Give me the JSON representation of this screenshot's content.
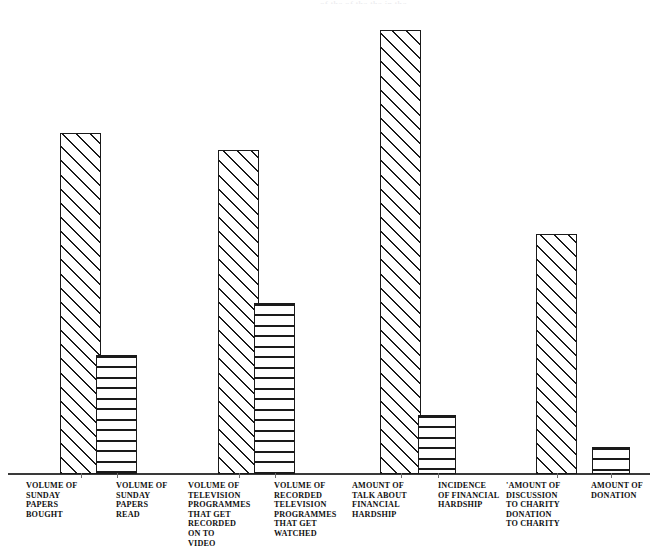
{
  "figure": {
    "background_color": "#ffffff",
    "ink_color": "#1a1a1a",
    "axis_color": "#3a3a3a",
    "baseline_y": 474,
    "top_cut_text": "of      the      of the        the          in the"
  },
  "chart_data": {
    "type": "bar",
    "title": "",
    "subtitle": "",
    "xlabel": "",
    "ylabel": "",
    "grid": false,
    "legend": "none",
    "axis": {
      "y_axis_visible": false,
      "x_axis_visible": true,
      "tick_labels_visible": false,
      "ylim": [
        0,
        480
      ]
    },
    "value_units": "relative volume (pixel height, unlabelled axis)",
    "categories": [
      "VOLUME OF\nSUNDAY\nPAPERS\nBOUGHT",
      "VOLUME OF\nSUNDAY\nPAPERS\nREAD",
      "VOLUME OF\nTELEVISION\nPROGRAMMES\nTHAT GET\nRECORDED\nON TO\nVIDEO",
      "VOLUME OF\nRECORDED\nTELEVISION\nPROGRAMMES\nTHAT GET\nWATCHED",
      "AMOUNT OF\nTALK ABOUT\nFINANCIAL\nHARDSHIP",
      "INCIDENCE\nOF FINANCIAL\nHARDSHIP",
      "'AMOUNT OF\nDISCUSSION\nTO CHARITY\nDONATION\nTO CHARITY",
      "AMOUNT OF\nDONATION"
    ],
    "values": [
      341,
      119,
      324,
      171,
      444,
      59,
      240,
      27
    ],
    "bars": [
      {
        "index": 1,
        "label": "VOLUME OF\nSUNDAY\nPAPERS\nBOUGHT",
        "value": 341,
        "pattern": "diagonal-hatch",
        "x": 60,
        "width": 41,
        "top": 133,
        "label_x": 26,
        "label_width": 70,
        "tick_x": 81
      },
      {
        "index": 2,
        "label": "VOLUME OF\nSUNDAY\nPAPERS\nREAD",
        "value": 119,
        "pattern": "horizontal-hatch",
        "x": 96,
        "width": 41,
        "top": 355,
        "label_x": 116,
        "label_width": 70,
        "tick_x": 117
      },
      {
        "index": 3,
        "label": "VOLUME OF\nTELEVISION\nPROGRAMMES\nTHAT GET\nRECORDED\nON TO\nVIDEO",
        "value": 324,
        "pattern": "diagonal-hatch",
        "x": 218,
        "width": 41,
        "top": 150,
        "label_x": 188,
        "label_width": 74,
        "tick_x": 239
      },
      {
        "index": 4,
        "label": "VOLUME OF\nRECORDED\nTELEVISION\nPROGRAMMES\nTHAT GET\nWATCHED",
        "value": 171,
        "pattern": "horizontal-hatch",
        "x": 254,
        "width": 41,
        "top": 303,
        "label_x": 274,
        "label_width": 74,
        "tick_x": 275
      },
      {
        "index": 5,
        "label": "AMOUNT OF\nTALK ABOUT\nFINANCIAL\nHARDSHIP",
        "value": 444,
        "pattern": "diagonal-hatch",
        "x": 380,
        "width": 41,
        "top": 30,
        "label_x": 352,
        "label_width": 74,
        "tick_x": 401
      },
      {
        "index": 6,
        "label": "INCIDENCE\nOF FINANCIAL\nHARDSHIP",
        "value": 59,
        "pattern": "horizontal-hatch",
        "x": 418,
        "width": 38,
        "top": 415,
        "label_x": 438,
        "label_width": 74,
        "tick_x": 438
      },
      {
        "index": 7,
        "label": "'AMOUNT OF\nDISCUSSION\nTO CHARITY\nDONATION\nTO CHARITY",
        "value": 240,
        "pattern": "diagonal-hatch",
        "x": 536,
        "width": 41,
        "top": 234,
        "label_x": 506,
        "label_width": 72,
        "tick_x": 557
      },
      {
        "index": 8,
        "label": "AMOUNT OF\nDONATION",
        "value": 27,
        "pattern": "horizontal-hatch",
        "x": 592,
        "width": 38,
        "top": 447,
        "label_x": 591,
        "label_width": 72,
        "tick_x": 611
      }
    ]
  }
}
